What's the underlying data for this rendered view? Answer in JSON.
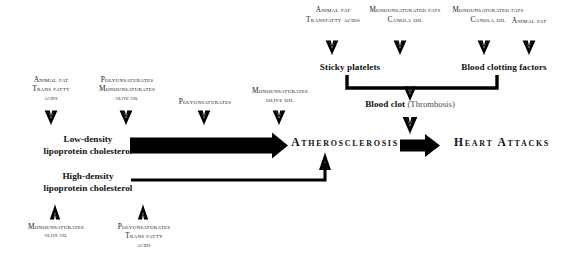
{
  "diagram": {
    "colors": {
      "ink": "#000000",
      "bar": "#000000",
      "muted": "#4a4a4a",
      "background": "#ffffff"
    }
  },
  "top_sources": [
    {
      "line1": "Animal fat",
      "line2": "Transfatty acids",
      "line3": ""
    },
    {
      "line1": "Monounsaturated fats",
      "line2": "Canola oil",
      "line3": ""
    },
    {
      "line1": "Monounsaturated fats",
      "line2": "Canola oil",
      "line3": ""
    },
    {
      "line1": "Animal fat",
      "line2": "",
      "line3": ""
    }
  ],
  "mid_sources": [
    {
      "line1": "Animal fat",
      "line2": "Trans fatty",
      "line3": "acids"
    },
    {
      "line1": "Polyunsaturates",
      "line2": "Monounsaturates",
      "line3": "olive oil"
    },
    {
      "line1": "Polyunsaturates",
      "line2": "",
      "line3": ""
    },
    {
      "line1": "Monounsaturates",
      "line2": "olive oil",
      "line3": ""
    }
  ],
  "bottom_sources": [
    {
      "line1": "Monounsaturates",
      "line2": "olive oil",
      "line3": ""
    },
    {
      "line1": "Polyunsaturates",
      "line2": "Trans fatty",
      "line3": "acids"
    }
  ],
  "nodes": {
    "sticky_platelets": "Sticky platelets",
    "blood_clotting_factors": "Blood clotting factors",
    "blood_clot": "Blood clot",
    "blood_clot_paren": " (Thrombosis)",
    "ldl_line1": "Low-density",
    "ldl_line2": "lipoprotein cholesterol",
    "hdl_line1": "High-density",
    "hdl_line2": "lipoprotein cholesterol",
    "oxidation": "Oxidation",
    "atherosclerosis": "Atherosclerosis",
    "heart_attacks": "Heart Attacks"
  },
  "icons": {
    "down_arrow": "down-arrow-icon",
    "up_arrow": "up-arrow-icon",
    "bracket": "bracket-connector-icon",
    "thick_arrow": "thick-block-arrow-icon"
  }
}
